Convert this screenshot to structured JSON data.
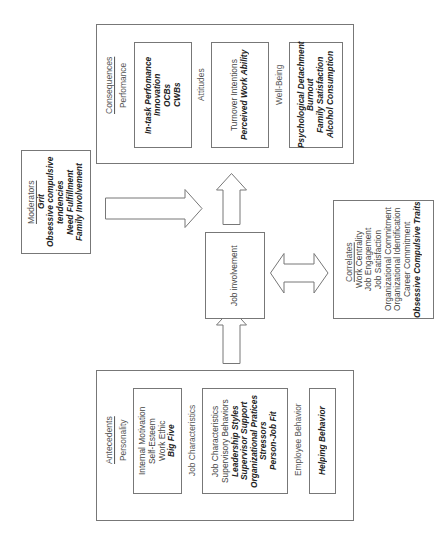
{
  "diagram": {
    "consequences": {
      "title": "Consequences",
      "performance": {
        "label": "Perfomance",
        "items": [
          "In-task Perfomance",
          "Innovation",
          "OCBs",
          "CWBs"
        ]
      },
      "attitudes": {
        "label": "Attitudes",
        "items_plain": [
          "Turnover Intentions"
        ],
        "items_bold": [
          "Perceived Work Ability"
        ]
      },
      "well_being": {
        "label": "Well-Being",
        "items": [
          "Psychological Detachment",
          "Burnout",
          "Family Satisfaction",
          "Alcohol Consumption"
        ]
      }
    },
    "moderators": {
      "title": "Moderators",
      "items": [
        "Grit",
        "Obsessive compulsive",
        "tendencies",
        "Need Fulfillment",
        "Family Involvement"
      ]
    },
    "job_involvement": {
      "label": "Job involvement"
    },
    "correlates": {
      "title": "Correlates",
      "items_plain": [
        "Work Centrality",
        "Job Engagement",
        "Job Satisfaction",
        "Organizational Commitment",
        "Organizational Identification",
        "Career Commitment"
      ],
      "items_bold": [
        "Obsessive Compulsive Traits"
      ]
    },
    "antecedents": {
      "title": "Antecedents",
      "personality": {
        "label": "Personality",
        "items_plain": [
          "Internal Motivation",
          "Self-Esteem",
          "Work Ethic"
        ],
        "items_bold": [
          "Big Five"
        ]
      },
      "job_characteristics": {
        "label": "Job Characteristics",
        "items_plain": [
          "Job Characteristics",
          "Supervisory Behaviors"
        ],
        "items_bold": [
          "Leadership Styles",
          "Supervisor Support",
          "Organizational Pratices",
          "Stressors",
          "Person-Job Fit"
        ]
      },
      "employee_behavior": {
        "label": "Employee Behavior",
        "items_bold": [
          "Helping Behavior"
        ]
      }
    },
    "arrows": [
      {
        "from": "antecedents",
        "to": "job_involvement",
        "type": "single"
      },
      {
        "from": "job_involvement",
        "to": "consequences",
        "type": "single"
      },
      {
        "from": "moderators",
        "to": "job_involvement-consequences link",
        "type": "single"
      },
      {
        "from": "job_involvement",
        "to": "correlates",
        "type": "double"
      }
    ]
  }
}
